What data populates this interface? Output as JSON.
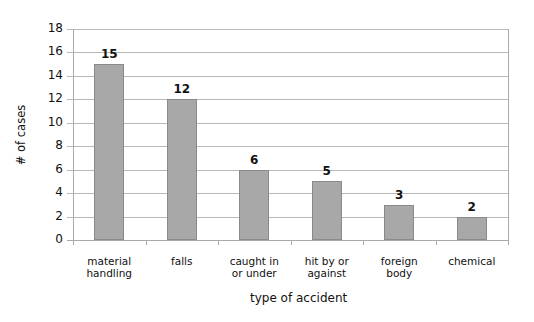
{
  "chart_data": {
    "type": "bar",
    "title": "",
    "xlabel": "type of accident",
    "ylabel": "# of cases",
    "ylim": [
      0,
      18
    ],
    "yticks": [
      0,
      2,
      4,
      6,
      8,
      10,
      12,
      14,
      16,
      18
    ],
    "grid": true,
    "legend": null,
    "categories": [
      "material\nhandling",
      "falls",
      "caught in\nor under",
      "hit by or\nagainst",
      "foreign\nbody",
      "chemical"
    ],
    "values": [
      15,
      12,
      6,
      5,
      3,
      2
    ],
    "data_labels": [
      "15",
      "12",
      "6",
      "5",
      "3",
      "2"
    ],
    "bar_color": "#a8a8a8"
  }
}
